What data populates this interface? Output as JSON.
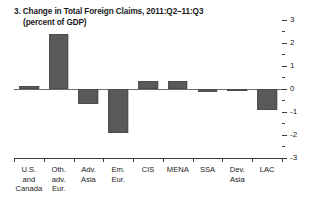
{
  "chart_data": {
    "type": "bar",
    "title": "3. Change in Total Foreign Claims, 2011:Q2–11:Q3",
    "subtitle": "(percent of GDP)",
    "xlabel": "",
    "ylabel": "",
    "ylim": [
      -3,
      3
    ],
    "y_axis_position": "right",
    "grid": false,
    "legend": "none",
    "bar_color": "#58595b",
    "major_ticks": [
      3,
      2,
      1,
      0,
      -1,
      -2,
      -3
    ],
    "minor_ticks": [
      2.5,
      1.5,
      0.5,
      -0.5,
      -1.5,
      -2.5
    ],
    "tick_labels": [
      "3",
      "2",
      "1",
      "0",
      "-1",
      "-2",
      "-3"
    ],
    "categories": [
      "U.S.\nand\nCanada",
      "Oth.\nadv.\nEur.",
      "Adv.\nAsia",
      "Em.\nEur.",
      "CIS",
      "MENA",
      "SSA",
      "Dev.\nAsia",
      "LAC"
    ],
    "category_names": [
      "U.S. and Canada",
      "Oth. adv. Eur.",
      "Adv. Asia",
      "Em. Eur.",
      "CIS",
      "MENA",
      "SSA",
      "Dev. Asia",
      "LAC"
    ],
    "values": [
      0.15,
      2.4,
      -0.65,
      -1.9,
      0.35,
      0.35,
      -0.12,
      0.0,
      -0.9
    ]
  }
}
